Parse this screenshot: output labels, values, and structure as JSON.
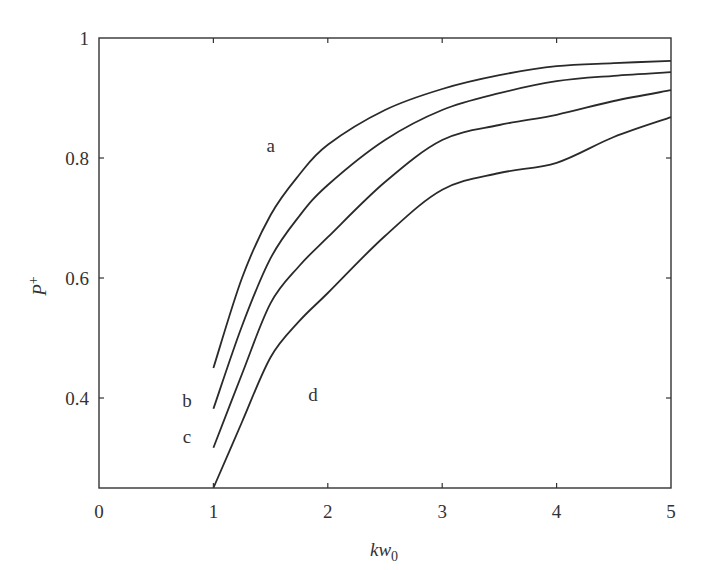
{
  "chart_data": {
    "type": "line",
    "title": "",
    "xlabel": "kw",
    "xlabel_sub": "0",
    "ylabel": "P",
    "ylabel_sup": "+",
    "xlim": [
      0,
      5
    ],
    "ylim": [
      0.25,
      1
    ],
    "xticks": [
      0,
      1,
      2,
      3,
      4,
      5
    ],
    "xtick_labels": [
      "0",
      "1",
      "2",
      "3",
      "4",
      "5"
    ],
    "yticks": [
      0.4,
      0.6,
      0.8,
      1
    ],
    "ytick_labels": [
      "0.4",
      "0.6",
      "0.8",
      "1"
    ],
    "grid": false,
    "legend": "none (curves labeled inline)",
    "x": [
      1.0,
      1.25,
      1.5,
      1.75,
      2.0,
      2.5,
      3.0,
      3.5,
      4.0,
      4.5,
      5.0
    ],
    "series": [
      {
        "name": "a",
        "values": [
          0.45,
          0.6,
          0.705,
          0.772,
          0.822,
          0.88,
          0.915,
          0.938,
          0.953,
          0.958,
          0.962
        ]
      },
      {
        "name": "b",
        "values": [
          0.382,
          0.52,
          0.633,
          0.703,
          0.755,
          0.83,
          0.88,
          0.908,
          0.928,
          0.937,
          0.943
        ]
      },
      {
        "name": "c",
        "values": [
          0.317,
          0.44,
          0.558,
          0.62,
          0.668,
          0.76,
          0.83,
          0.855,
          0.872,
          0.895,
          0.913
        ]
      },
      {
        "name": "d",
        "values": [
          0.25,
          0.36,
          0.468,
          0.528,
          0.575,
          0.67,
          0.747,
          0.775,
          0.792,
          0.835,
          0.868
        ]
      }
    ],
    "annotations": [
      {
        "text": "a",
        "x": 1.5,
        "y": 0.81
      },
      {
        "text": "b",
        "x": 0.77,
        "y": 0.385
      },
      {
        "text": "c",
        "x": 0.77,
        "y": 0.325
      },
      {
        "text": "d",
        "x": 1.87,
        "y": 0.395
      }
    ]
  },
  "style": {
    "line_color": "#2a2a2a",
    "axis_color": "#333333",
    "background": "#ffffff"
  }
}
